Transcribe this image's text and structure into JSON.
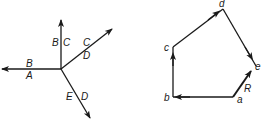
{
  "left_diagram": {
    "title": "Forces at a joint (Bow's notation)",
    "labels": {
      "up_left": "B",
      "up_right": "C",
      "ur_top": "C",
      "ur_bottom": "D",
      "left_top": "B",
      "left_bottom": "A",
      "dr_left": "E",
      "dr_right": "D"
    }
  },
  "right_diagram": {
    "title": "Force polygon",
    "vertices": {
      "a": "a",
      "b": "b",
      "c": "c",
      "d": "d",
      "e": "e"
    },
    "resultant_label": "R"
  },
  "colors": {
    "stroke": "#1a1a1a",
    "background": "#ffffff"
  }
}
